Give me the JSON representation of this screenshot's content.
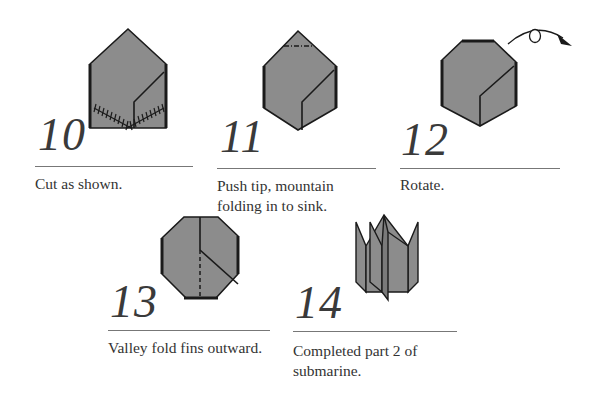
{
  "diagram": {
    "colors": {
      "paper_fill": "#8c8c8c",
      "outline": "#1a1a1a",
      "rule": "#777777",
      "text": "#333333"
    },
    "steps": [
      {
        "number": "10",
        "caption_lines": [
          "Cut as shown."
        ],
        "figure": "pentagon-house-with-cut-lines",
        "symbols": [
          "cut-marks"
        ]
      },
      {
        "number": "11",
        "caption_lines": [
          "Push tip, mountain",
          "folding in to sink."
        ],
        "figure": "hexagon-with-mountain-fold-tip",
        "symbols": [
          "mountain-fold-line"
        ]
      },
      {
        "number": "12",
        "caption_lines": [
          "Rotate."
        ],
        "figure": "octagon-sunk-tip",
        "symbols": [
          "rotate-arrow"
        ]
      },
      {
        "number": "13",
        "caption_lines": [
          "Valley fold fins outward."
        ],
        "figure": "octagon-rotated-with-valley-fold",
        "symbols": [
          "valley-fold-line"
        ]
      },
      {
        "number": "14",
        "caption_lines": [
          "Completed part 2 of",
          "submarine."
        ],
        "figure": "completed-fins-model",
        "symbols": []
      }
    ]
  }
}
